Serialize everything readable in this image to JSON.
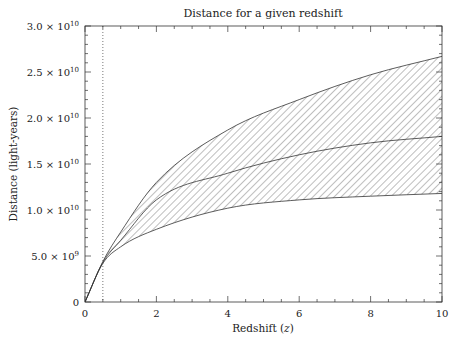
{
  "chart_data": {
    "type": "area",
    "title": "Distance for a given redshift",
    "xlabel": "Redshift (z)",
    "ylabel": "Distance (light-years)",
    "xlim": [
      0,
      10
    ],
    "ylim": [
      0,
      30000000000.0
    ],
    "x_ticks": [
      0,
      2,
      4,
      6,
      8,
      10
    ],
    "x_tick_labels": [
      "0",
      "2",
      "4",
      "6",
      "8",
      "10"
    ],
    "x_minor_step": 0.5,
    "y_ticks": [
      0,
      5000000000.0,
      10000000000.0,
      15000000000.0,
      20000000000.0,
      25000000000.0,
      30000000000.0
    ],
    "y_tick_labels": [
      {
        "mantissa": "0",
        "exp": ""
      },
      {
        "mantissa": "5.0 × 10",
        "exp": "9"
      },
      {
        "mantissa": "1.0 × 10",
        "exp": "10"
      },
      {
        "mantissa": "1.5 × 10",
        "exp": "10"
      },
      {
        "mantissa": "2.0 × 10",
        "exp": "10"
      },
      {
        "mantissa": "2.5 × 10",
        "exp": "10"
      },
      {
        "mantissa": "3.0 × 10",
        "exp": "10"
      }
    ],
    "y_minor_step": 1000000000.0,
    "grid": false,
    "vertical_marker": {
      "x": 0.5,
      "style": "dotted"
    },
    "x": [
      0,
      0.5,
      1,
      2,
      4,
      6,
      8,
      10
    ],
    "series": [
      {
        "name": "upper bound",
        "values": [
          0,
          4400000000.0,
          7600000000.0,
          13000000000.0,
          18700000000.0,
          22000000000.0,
          24700000000.0,
          26700000000.0
        ]
      },
      {
        "name": "central",
        "values": [
          0,
          4300000000.0,
          6700000000.0,
          11100000000.0,
          14000000000.0,
          16000000000.0,
          17300000000.0,
          18000000000.0
        ]
      },
      {
        "name": "lower bound",
        "values": [
          0,
          4200000000.0,
          6000000000.0,
          7900000000.0,
          10200000000.0,
          11100000000.0,
          11500000000.0,
          11800000000.0
        ]
      }
    ],
    "shaded_region": {
      "between": [
        "upper bound",
        "lower bound"
      ],
      "fill": "hatched"
    }
  }
}
